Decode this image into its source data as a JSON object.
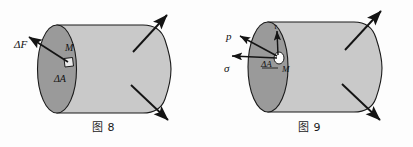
{
  "document": {
    "kind": "engineering-mechanics-figures",
    "background_color": "#fdfdfd",
    "width": 413,
    "height": 147
  },
  "palette": {
    "outline": "#1a1a1a",
    "cylinder_body_fill": "#c9c9c9",
    "cross_section_fill": "#9a9a9a",
    "highlight_fill": "#ffffff",
    "label_color": "#111111",
    "arrow_color": "#141414"
  },
  "figures": [
    {
      "id": "figure-8",
      "caption": "图 8",
      "labels": {
        "force": "ΔF",
        "point": "M",
        "area": "ΔA"
      },
      "elements": {
        "cross_section": "shaded elliptical cut face",
        "area_patch": "small square element ΔA at point M",
        "force_vector": "ΔF resultant force arrow pointing up-left from M",
        "external_load_top": "diagonal arrow pointing up-right",
        "external_load_bottom": "diagonal arrow pointing down-right"
      }
    },
    {
      "id": "figure-9",
      "caption": "图 9",
      "labels": {
        "pressure": "p",
        "normal_stress": "σ",
        "shear_stress": "τ",
        "point": "M",
        "area": "ΔA"
      },
      "elements": {
        "cross_section": "shaded elliptical cut face",
        "area_patch": "small circular element ΔA at point M",
        "pressure_vector": "p full stress arrow pointing up-left from M",
        "normal_vector": "σ normal stress arrow pointing left from M",
        "shear_vector": "τ shear stress arrow pointing up from M",
        "external_load_top": "diagonal arrow pointing up-right",
        "external_load_bottom": "diagonal arrow pointing down-right"
      }
    }
  ]
}
